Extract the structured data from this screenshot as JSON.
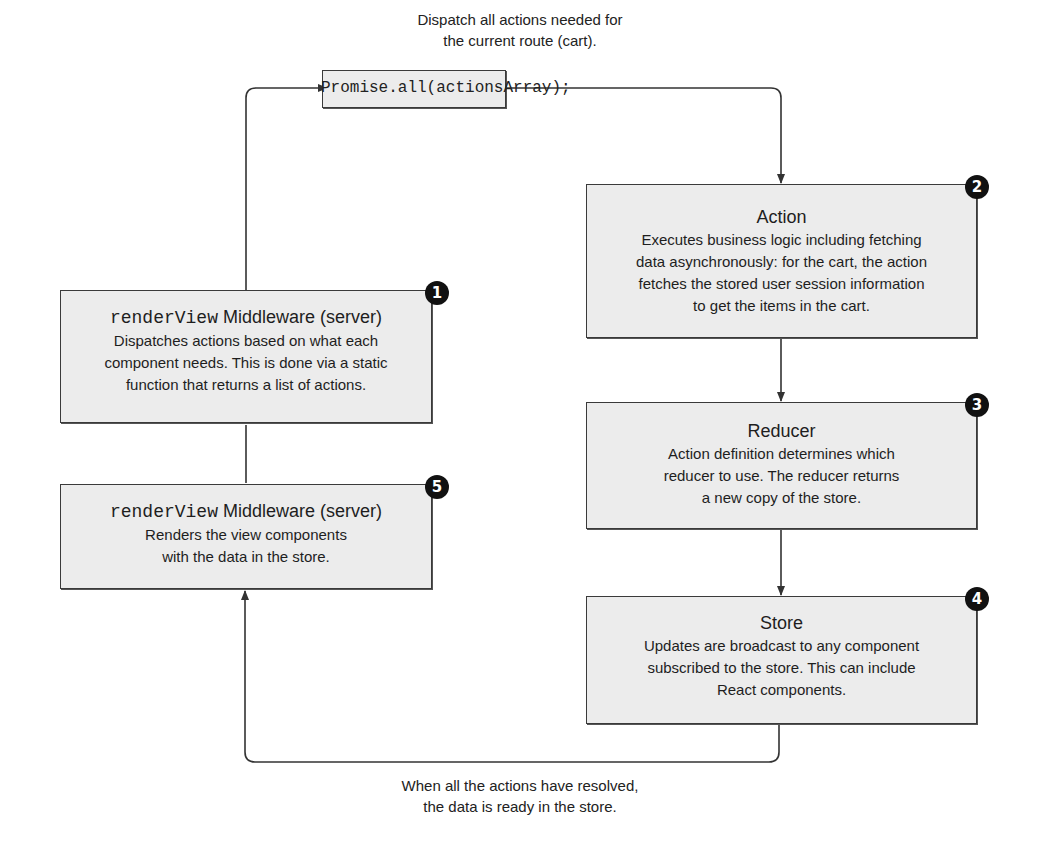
{
  "diagram": {
    "top_caption": [
      "Dispatch all actions needed for",
      "the current route (cart)."
    ],
    "bottom_caption": [
      "When all the actions have resolved,",
      "the data is ready in the store."
    ],
    "promise_box": {
      "code": "Promise.all(actionsArray);"
    },
    "steps": [
      {
        "number": "1",
        "title_code": "renderView",
        "title": "Middleware (server)",
        "body": [
          "Dispatches actions based on what each",
          "component needs. This is done via a static",
          "function that returns a list of actions."
        ]
      },
      {
        "number": "2",
        "title_code": "",
        "title": "Action",
        "body": [
          "Executes business logic including fetching",
          "data asynchronously: for the cart, the action",
          "fetches the stored user session information",
          "to get the items in the cart."
        ]
      },
      {
        "number": "3",
        "title_code": "",
        "title": "Reducer",
        "body": [
          "Action definition determines which",
          "reducer to use. The reducer returns",
          "a new copy of the store."
        ]
      },
      {
        "number": "4",
        "title_code": "",
        "title": "Store",
        "body": [
          "Updates are broadcast to any component",
          "subscribed to the store. This can include",
          "React components."
        ]
      },
      {
        "number": "5",
        "title_code": "renderView",
        "title": "Middleware (server)",
        "body": [
          "Renders the view components",
          "with the data in the store."
        ]
      }
    ],
    "colors": {
      "box_fill": "#ececec",
      "box_border": "#3a3a3a",
      "badge": "#111111",
      "line": "#333333"
    }
  }
}
